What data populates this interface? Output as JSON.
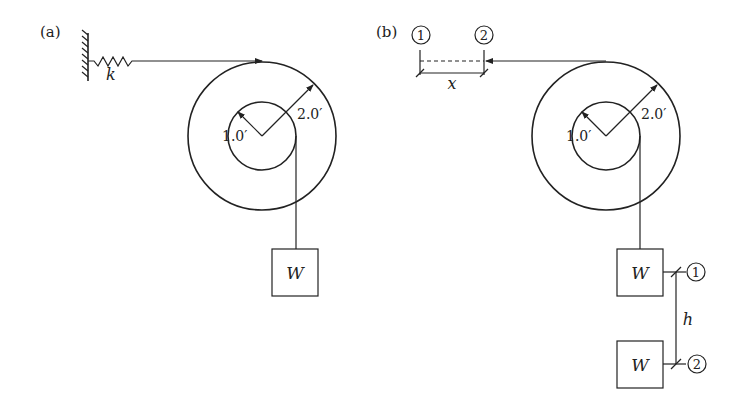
{
  "panels": [
    {
      "id": "a",
      "label": "(a)",
      "spring_label": "k",
      "inner_radius_label": "1.0′",
      "outer_radius_label": "2.0′",
      "weight_label": "W"
    },
    {
      "id": "b",
      "label": "(b)",
      "position_1": "1",
      "position_2": "2",
      "displacement_label": "x",
      "inner_radius_label": "1.0′",
      "outer_radius_label": "2.0′",
      "weight_label_top": "W",
      "weight_label_bottom": "W",
      "height_label": "h",
      "height_pos_1": "1",
      "height_pos_2": "2"
    }
  ],
  "colors": {
    "ink": "#222222",
    "background": "#ffffff"
  }
}
